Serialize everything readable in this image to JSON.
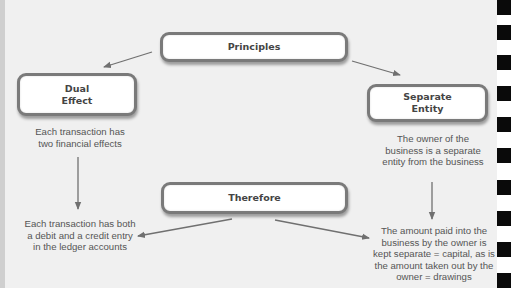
{
  "diagram": {
    "nodes": {
      "principles": "Principles",
      "dual_effect": {
        "line1": "Dual",
        "line2": "Effect"
      },
      "separate_entity": {
        "line1": "Separate",
        "line2": "Entity"
      },
      "therefore": "Therefore"
    },
    "descriptions": {
      "dual_effect": [
        "Each transaction has",
        "two financial effects"
      ],
      "separate_entity": [
        "The owner of the",
        "business is a separate",
        "entity from the business"
      ],
      "dual_effect_result": [
        "Each transaction has both",
        "a debit and a credit entry",
        "in the ledger accounts"
      ],
      "separate_entity_result": [
        "The amount paid into the",
        "business by the owner is",
        "kept separate = capital, as is",
        "the amount taken out by the",
        "owner = drawings"
      ]
    },
    "edges": [
      {
        "from": "Principles",
        "to": "Dual Effect"
      },
      {
        "from": "Principles",
        "to": "Separate Entity"
      },
      {
        "from": "Dual Effect",
        "to": "Each transaction has both a debit and a credit entry in the ledger accounts"
      },
      {
        "from": "Separate Entity",
        "to": "The amount paid into the business by the owner is kept separate = capital, as is the amount taken out by the owner = drawings"
      },
      {
        "from": "Therefore",
        "to": "Each transaction has both a debit and a credit entry in the ledger accounts"
      },
      {
        "from": "Therefore",
        "to": "The amount paid into the business by the owner is kept separate = capital, as is the amount taken out by the owner = drawings"
      }
    ],
    "colors": {
      "background": "#f0f0f0",
      "box_border": "#7a7a7a",
      "box_fill": "#ffffff",
      "arrow": "#707070",
      "text": "#555555",
      "binding_squares": "#0a0a0a"
    }
  }
}
